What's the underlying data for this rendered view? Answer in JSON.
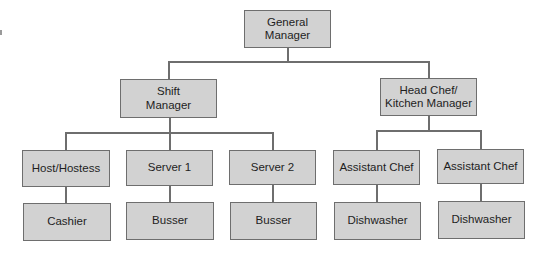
{
  "diagram": {
    "type": "org-chart",
    "colors": {
      "box_fill": "#d2d2d2",
      "box_border": "#6e6e6e",
      "line": "#6e6e6e",
      "text": "#1e1e1e",
      "background": "#ffffff"
    },
    "nodes": {
      "general_manager": {
        "label": "General\nManager"
      },
      "shift_manager": {
        "label": "Shift\nManager"
      },
      "head_chef": {
        "label": "Head Chef/\nKitchen Manager"
      },
      "host_hostess": {
        "label": "Host/Hostess"
      },
      "server_1": {
        "label": "Server 1"
      },
      "server_2": {
        "label": "Server 2"
      },
      "assistant_chef_1": {
        "label": "Assistant Chef"
      },
      "assistant_chef_2": {
        "label": "Assistant Chef"
      },
      "cashier": {
        "label": "Cashier"
      },
      "busser_1": {
        "label": "Busser"
      },
      "busser_2": {
        "label": "Busser"
      },
      "dishwasher_1": {
        "label": "Dishwasher"
      },
      "dishwasher_2": {
        "label": "Dishwasher"
      }
    },
    "edges": [
      [
        "General Manager",
        "Shift Manager"
      ],
      [
        "General Manager",
        "Head Chef/Kitchen Manager"
      ],
      [
        "Shift Manager",
        "Host/Hostess"
      ],
      [
        "Shift Manager",
        "Server 1"
      ],
      [
        "Shift Manager",
        "Server 2"
      ],
      [
        "Head Chef/Kitchen Manager",
        "Assistant Chef"
      ],
      [
        "Head Chef/Kitchen Manager",
        "Assistant Chef"
      ],
      [
        "Host/Hostess",
        "Cashier"
      ],
      [
        "Server 1",
        "Busser"
      ],
      [
        "Server 2",
        "Busser"
      ],
      [
        "Assistant Chef",
        "Dishwasher"
      ],
      [
        "Assistant Chef",
        "Dishwasher"
      ]
    ]
  }
}
